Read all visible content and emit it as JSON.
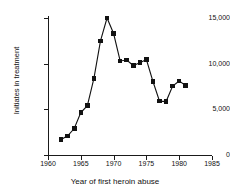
{
  "chart_data": {
    "type": "line",
    "title": "",
    "xlabel": "Year of first heroin abuse",
    "ylabel": "Initiates in treatment",
    "xlim": [
      1960,
      1985
    ],
    "ylim": [
      0,
      15000
    ],
    "xticks": [
      1960,
      1965,
      1970,
      1975,
      1980,
      1985
    ],
    "xtick_labels": [
      "1960",
      "1965",
      "1970",
      "1975",
      "1980",
      "1985"
    ],
    "yticks": [
      0,
      5000,
      10000,
      15000
    ],
    "ytick_labels": [
      "0",
      "5,000",
      "10,000",
      "15,000"
    ],
    "grid": false,
    "legend": null,
    "marker": "square",
    "marker_color": "#121212",
    "line_color": "#121212",
    "x": [
      1962,
      1963,
      1964,
      1965,
      1966,
      1967,
      1968,
      1969,
      1970,
      1971,
      1972,
      1973,
      1974,
      1975,
      1976,
      1977,
      1978,
      1979,
      1980,
      1981
    ],
    "values": [
      1700,
      2100,
      2900,
      4650,
      5400,
      8400,
      12500,
      15000,
      13300,
      10300,
      10400,
      9800,
      10100,
      10450,
      8050,
      5900,
      5850,
      7550,
      8100,
      7600
    ]
  }
}
